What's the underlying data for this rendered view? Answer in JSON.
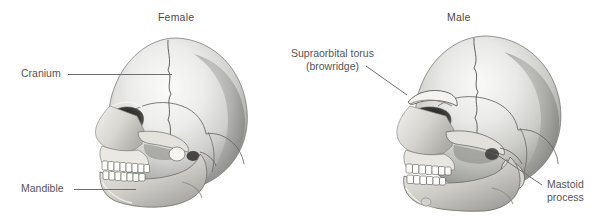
{
  "figure": {
    "background_color": "#ffffff",
    "text_color": "#555555",
    "leader_line_color": "#6f6f6f"
  },
  "panels": [
    {
      "id": "female",
      "title": "Female",
      "illustration": "female-skull-lateral-view",
      "callouts": [
        {
          "id": "cranium",
          "text": "Cranium",
          "side": "left"
        },
        {
          "id": "mandible",
          "text": "Mandible",
          "side": "left"
        }
      ]
    },
    {
      "id": "male",
      "title": "Male",
      "illustration": "male-skull-lateral-view",
      "callouts": [
        {
          "id": "supraorbital",
          "line1": "Supraorbital torus",
          "line2": "(browridge)",
          "side": "left"
        },
        {
          "id": "mastoid",
          "line1": "Mastoid",
          "line2": "process",
          "side": "right"
        }
      ]
    }
  ]
}
